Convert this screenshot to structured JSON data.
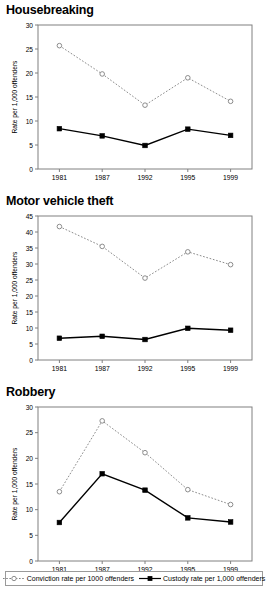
{
  "figure": {
    "width": 268,
    "height": 595,
    "background": "#ffffff",
    "axis_color": "#808080",
    "series_colors": {
      "conviction": "#808080",
      "custody": "#000000"
    }
  },
  "legend": {
    "entries": [
      {
        "label": "Conviction rate per 1000 offenders",
        "marker": "open-circle-icon",
        "line_style": "dotted",
        "color": "#808080"
      },
      {
        "label": "Custody rate per 1,000 offenders",
        "marker": "filled-square-icon",
        "line_style": "solid",
        "color": "#000000"
      }
    ]
  },
  "chart_data": [
    {
      "type": "line",
      "title": "Housebreaking",
      "xlabel": "",
      "ylabel": "Rate per 1,000 offenders",
      "categories": [
        "1981",
        "1987",
        "1992",
        "1995",
        "1999"
      ],
      "ylim": [
        0,
        30
      ],
      "yticks": [
        0,
        5,
        10,
        15,
        20,
        25,
        30
      ],
      "grid": false,
      "legend_position": "bottom-shared",
      "series": [
        {
          "name": "Conviction rate per 1000 offenders",
          "values": [
            25.7,
            19.8,
            13.3,
            19.0,
            14.1
          ],
          "marker": "open-circle",
          "line_style": "dotted",
          "color": "#808080"
        },
        {
          "name": "Custody rate per 1,000 offenders",
          "values": [
            8.4,
            6.9,
            4.9,
            8.3,
            7.0
          ],
          "marker": "filled-square",
          "line_style": "solid",
          "color": "#000000"
        }
      ]
    },
    {
      "type": "line",
      "title": "Motor vehicle theft",
      "xlabel": "",
      "ylabel": "Rate per 1,000 offenders",
      "categories": [
        "1981",
        "1987",
        "1992",
        "1995",
        "1999"
      ],
      "ylim": [
        0,
        45
      ],
      "yticks": [
        0,
        5,
        10,
        15,
        20,
        25,
        30,
        35,
        40,
        45
      ],
      "grid": false,
      "legend_position": "bottom-shared",
      "series": [
        {
          "name": "Conviction rate per 1000 offenders",
          "values": [
            41.7,
            35.5,
            25.6,
            33.8,
            29.8
          ],
          "marker": "open-circle",
          "line_style": "dotted",
          "color": "#808080"
        },
        {
          "name": "Custody rate per 1,000 offenders",
          "values": [
            6.8,
            7.4,
            6.4,
            9.9,
            9.3
          ],
          "marker": "filled-square",
          "line_style": "solid",
          "color": "#000000"
        }
      ]
    },
    {
      "type": "line",
      "title": "Robbery",
      "xlabel": "",
      "ylabel": "Rate per 1,000 offenders",
      "categories": [
        "1981",
        "1987",
        "1992",
        "1995",
        "1999"
      ],
      "ylim": [
        0,
        30
      ],
      "yticks": [
        0,
        5,
        10,
        15,
        20,
        25,
        30
      ],
      "grid": false,
      "legend_position": "bottom-shared",
      "series": [
        {
          "name": "Conviction rate per 1000 offenders",
          "values": [
            13.5,
            27.3,
            21.1,
            13.9,
            11.0
          ],
          "marker": "open-circle",
          "line_style": "dotted",
          "color": "#808080"
        },
        {
          "name": "Custody rate per 1,000 offenders",
          "values": [
            7.5,
            17.0,
            13.8,
            8.4,
            7.6
          ],
          "marker": "filled-square",
          "line_style": "solid",
          "color": "#000000"
        }
      ]
    }
  ]
}
